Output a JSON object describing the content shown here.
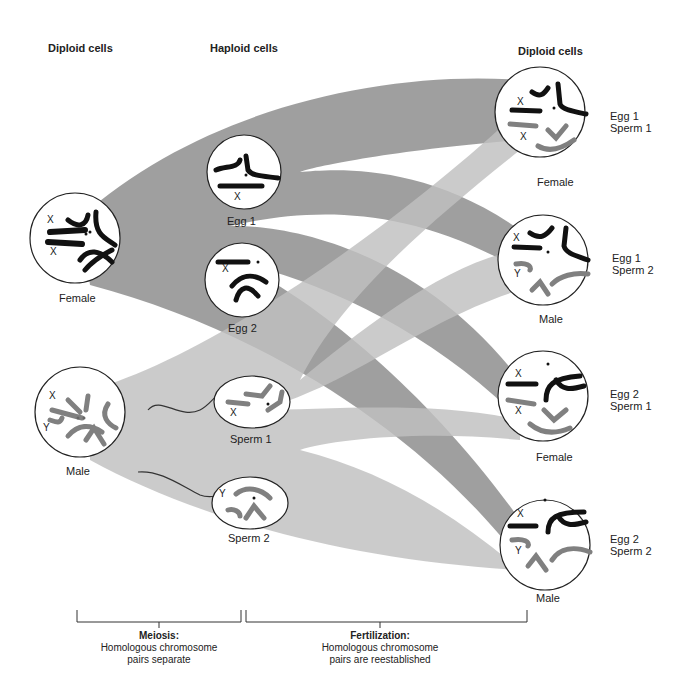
{
  "headers": {
    "left": "Diploid cells",
    "middle": "Haploid cells",
    "right": "Diploid cells"
  },
  "parents": [
    {
      "id": "female",
      "label": "Female",
      "chromosome_marks": [
        "X",
        "X"
      ]
    },
    {
      "id": "male",
      "label": "Male",
      "chromosome_marks": [
        "X",
        "Y"
      ]
    }
  ],
  "gametes": [
    {
      "id": "egg1",
      "label": "Egg 1",
      "chromosome_mark": "X"
    },
    {
      "id": "egg2",
      "label": "Egg 2",
      "chromosome_mark": "X"
    },
    {
      "id": "sperm1",
      "label": "Sperm 1",
      "chromosome_mark": "X"
    },
    {
      "id": "sperm2",
      "label": "Sperm 2",
      "chromosome_mark": "Y"
    }
  ],
  "offspring": [
    {
      "pair_line1": "Egg 1",
      "pair_line2": "Sperm 1",
      "sex": "Female",
      "marks": [
        "X",
        "X"
      ]
    },
    {
      "pair_line1": "Egg 1",
      "pair_line2": "Sperm 2",
      "sex": "Male",
      "marks": [
        "X",
        "Y"
      ]
    },
    {
      "pair_line1": "Egg 2",
      "pair_line2": "Sperm 1",
      "sex": "Female",
      "marks": [
        "X",
        "X"
      ]
    },
    {
      "pair_line1": "Egg 2",
      "pair_line2": "Sperm 2",
      "sex": "Male",
      "marks": [
        "X",
        "Y"
      ]
    }
  ],
  "brackets": {
    "meiosis": {
      "title": "Meiosis:",
      "line1": "Homologous chromosome",
      "line2": "pairs separate"
    },
    "fertilization": {
      "title": "Fertilization:",
      "line1": "Homologous chromosome",
      "line2": "pairs are reestablished"
    }
  },
  "colors": {
    "female_band": "#9a9a9a",
    "male_band": "#bdbdbd",
    "overlap": "#7a7a7a",
    "maternal_chromosome": "#111111",
    "paternal_chromosome": "#808080"
  }
}
